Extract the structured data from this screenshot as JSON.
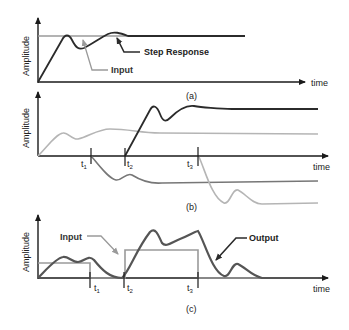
{
  "panels": [
    {
      "id": "a",
      "caption": "(a)",
      "y_axis_label": "Amplitude",
      "x_axis_label": "time",
      "annotations": {
        "step_response": "Step Response",
        "input": "Input"
      }
    },
    {
      "id": "b",
      "caption": "(b)",
      "y_axis_label": "Amplitude",
      "x_axis_label": "time",
      "time_markers": [
        {
          "base": "t",
          "sub": "1"
        },
        {
          "base": "t",
          "sub": "2"
        },
        {
          "base": "t",
          "sub": "3"
        }
      ]
    },
    {
      "id": "c",
      "caption": "(c)",
      "y_axis_label": "Amplitude",
      "x_axis_label": "time",
      "annotations": {
        "input": "Input",
        "output": "Output"
      },
      "time_markers": [
        {
          "base": "t",
          "sub": "1"
        },
        {
          "base": "t",
          "sub": "2"
        },
        {
          "base": "t",
          "sub": "3"
        }
      ]
    }
  ],
  "colors": {
    "axis": "#1a1a1a",
    "response_dark": "#2b2b2b",
    "response_mid": "#777777",
    "input_gray": "#9a9a9a",
    "light_gray": "#b5b5b5",
    "label": "#222222"
  }
}
